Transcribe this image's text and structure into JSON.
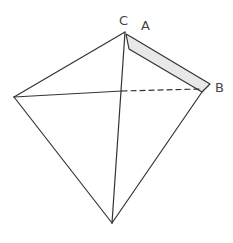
{
  "diagram": {
    "type": "tetrahedron-with-bar",
    "labels": {
      "C": "C",
      "A": "A",
      "B": "B"
    },
    "vertices": {
      "top": [
        125,
        32
      ],
      "left": [
        14,
        97
      ],
      "right": [
        204,
        87
      ],
      "bottom": [
        112,
        223
      ]
    },
    "colors": {
      "stroke": "#333333",
      "bar_fill": "#e8e8e8",
      "label": "#444444"
    }
  }
}
